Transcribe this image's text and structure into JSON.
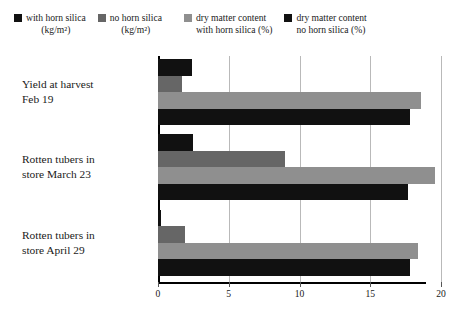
{
  "legend": {
    "items": [
      {
        "name": "with-horn-silica",
        "line1": "with horn silica",
        "line2": "(kg/m²)",
        "color": "#111111"
      },
      {
        "name": "no-horn-silica",
        "line1": "no horn silica",
        "line2": "(kg/m²)",
        "color": "#666666"
      },
      {
        "name": "dry-matter-with-horn-silica",
        "line1": "dry matter content",
        "line2": "with horn silica (%)",
        "color": "#8f8f8f"
      },
      {
        "name": "dry-matter-no-horn-silica",
        "line1": "dry matter content",
        "line2": "no horn silica (%)",
        "color": "#111111"
      }
    ]
  },
  "axis": {
    "ticks": [
      0,
      5,
      10,
      15,
      20
    ],
    "min": 0,
    "max": 20
  },
  "categories": [
    {
      "line1": "Yield at harvest",
      "line2": "Feb 19"
    },
    {
      "line1": "Rotten tubers in",
      "line2": "store March 23"
    },
    {
      "line1": "Rotten tubers in",
      "line2": "store April 29"
    }
  ],
  "chart_data": {
    "type": "bar",
    "orientation": "horizontal",
    "title": "",
    "xlabel": "",
    "ylabel": "",
    "xlim": [
      0,
      20
    ],
    "grid": true,
    "legend_position": "top",
    "categories": [
      "Yield at harvest Feb 19",
      "Rotten tubers in store March 23",
      "Rotten tubers in store April 29"
    ],
    "series": [
      {
        "name": "with horn silica (kg/m²)",
        "color": "#111111",
        "values": [
          2.4,
          2.5,
          0.2
        ]
      },
      {
        "name": "no horn silica (kg/m²)",
        "color": "#666666",
        "values": [
          1.7,
          9.0,
          1.9
        ]
      },
      {
        "name": "dry matter content with horn silica (%)",
        "color": "#8f8f8f",
        "values": [
          18.6,
          19.6,
          18.4
        ]
      },
      {
        "name": "dry matter content no horn silica (%)",
        "color": "#111111",
        "values": [
          17.8,
          17.7,
          17.8
        ]
      }
    ]
  }
}
